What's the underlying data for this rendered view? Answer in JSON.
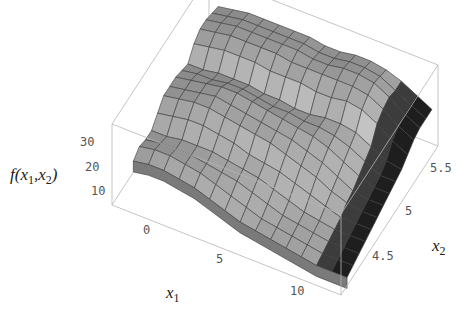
{
  "chart_data": {
    "type": "surface3d",
    "title": "",
    "xlabel": "x1",
    "ylabel": "x2",
    "zlabel": "f(x1,x2)",
    "x_range": [
      -3,
      12
    ],
    "y_range": [
      4.2,
      5.8
    ],
    "z_range": [
      5,
      35
    ],
    "x_ticks": [
      0,
      5,
      10
    ],
    "y_ticks": [
      4.5,
      5,
      5.5
    ],
    "z_ticks": [
      10,
      20,
      30
    ],
    "grid_x": [
      -2,
      -1,
      0,
      1,
      2,
      3,
      4,
      5,
      6,
      7,
      8,
      9,
      10,
      11,
      12
    ],
    "grid_y": [
      4.3,
      4.4,
      4.5,
      4.6,
      4.7,
      4.8,
      4.9,
      5.0,
      5.1,
      5.2,
      5.3,
      5.4,
      5.5,
      5.6,
      5.7
    ],
    "z": [
      [
        20,
        21,
        21,
        20,
        19,
        17,
        15,
        13,
        12,
        11,
        10,
        9,
        8,
        8,
        8
      ],
      [
        22,
        23,
        23,
        22,
        21,
        19,
        17,
        15,
        13,
        12,
        11,
        10,
        9,
        9,
        9
      ],
      [
        21,
        22,
        22,
        22,
        21,
        20,
        19,
        17,
        15,
        13,
        12,
        11,
        10,
        10,
        10
      ],
      [
        21,
        21,
        22,
        22,
        22,
        21,
        20,
        19,
        17,
        15,
        13,
        12,
        11,
        11,
        11
      ],
      [
        24,
        25,
        26,
        26,
        25,
        24,
        22,
        21,
        20,
        18,
        16,
        14,
        12,
        12,
        12
      ],
      [
        27,
        28,
        29,
        29,
        28,
        27,
        26,
        25,
        23,
        21,
        19,
        16,
        14,
        13,
        13
      ],
      [
        27,
        28,
        29,
        30,
        29,
        28,
        27,
        26,
        25,
        23,
        21,
        18,
        15,
        14,
        14
      ],
      [
        27,
        28,
        29,
        30,
        30,
        29,
        28,
        27,
        26,
        25,
        23,
        20,
        17,
        15,
        15
      ],
      [
        26,
        27,
        27,
        28,
        28,
        27,
        26,
        26,
        25,
        25,
        24,
        22,
        19,
        16,
        16
      ],
      [
        25,
        25,
        26,
        26,
        26,
        25,
        25,
        24,
        24,
        25,
        25,
        24,
        21,
        18,
        17
      ],
      [
        29,
        30,
        31,
        31,
        31,
        30,
        30,
        30,
        29,
        29,
        30,
        29,
        26,
        22,
        19
      ],
      [
        31,
        32,
        33,
        33,
        33,
        33,
        32,
        32,
        32,
        32,
        32,
        31,
        28,
        24,
        21
      ],
      [
        31,
        32,
        33,
        33,
        33,
        33,
        33,
        32,
        32,
        33,
        33,
        32,
        29,
        25,
        22
      ],
      [
        30,
        31,
        32,
        32,
        32,
        32,
        32,
        31,
        31,
        32,
        32,
        31,
        28,
        25,
        22
      ],
      [
        29,
        30,
        31,
        31,
        31,
        31,
        31,
        30,
        30,
        31,
        31,
        30,
        28,
        25,
        22
      ]
    ],
    "colors": {
      "box": "#b5b5b5",
      "edge": "#3a3a3a",
      "dark_face": "#1a1a1a"
    },
    "box_on": true,
    "grid": false
  },
  "labels": {
    "z_axis": {
      "f": "f(x",
      "s1": "1",
      "mid": ",x",
      "s2": "2",
      "end": ")"
    },
    "x_axis": {
      "main": "x",
      "sub": "1"
    },
    "y_axis": {
      "main": "x",
      "sub": "2"
    },
    "x_ticks": [
      "0",
      "5",
      "10"
    ],
    "y_ticks": [
      "4.5",
      "5",
      "5.5"
    ],
    "z_ticks": [
      "10",
      "20",
      "30"
    ]
  }
}
